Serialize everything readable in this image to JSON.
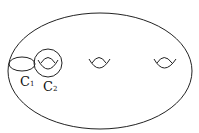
{
  "diagram": {
    "stroke_color": "#222222",
    "background": "#ffffff",
    "curves": [
      {
        "name": "C",
        "subscript": "1"
      },
      {
        "name": "C",
        "subscript": "2"
      }
    ],
    "holes": 3
  }
}
